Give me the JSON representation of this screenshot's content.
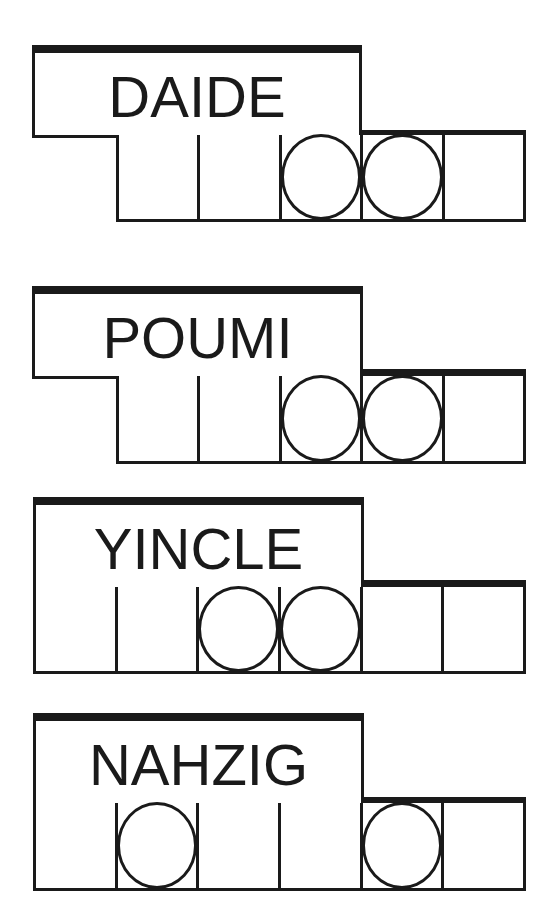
{
  "puzzles": [
    {
      "scrambled": "DAIDE",
      "letters": 5,
      "circled_positions": [
        3,
        4
      ],
      "cells": [
        {
          "circled": false
        },
        {
          "circled": false
        },
        {
          "circled": true
        },
        {
          "circled": true
        },
        {
          "circled": false
        }
      ]
    },
    {
      "scrambled": "POUMI",
      "letters": 5,
      "circled_positions": [
        3,
        4
      ],
      "cells": [
        {
          "circled": false
        },
        {
          "circled": false
        },
        {
          "circled": true
        },
        {
          "circled": true
        },
        {
          "circled": false
        }
      ]
    },
    {
      "scrambled": "YINCLE",
      "letters": 6,
      "circled_positions": [
        3,
        4
      ],
      "cells": [
        {
          "circled": false
        },
        {
          "circled": false
        },
        {
          "circled": true
        },
        {
          "circled": true
        },
        {
          "circled": false
        },
        {
          "circled": false
        }
      ]
    },
    {
      "scrambled": "NAHZIG",
      "letters": 6,
      "circled_positions": [
        2,
        5
      ],
      "cells": [
        {
          "circled": false
        },
        {
          "circled": true
        },
        {
          "circled": false
        },
        {
          "circled": false
        },
        {
          "circled": true
        },
        {
          "circled": false
        }
      ]
    }
  ],
  "colors": {
    "ink": "#1a1a1a",
    "background": "#ffffff"
  }
}
